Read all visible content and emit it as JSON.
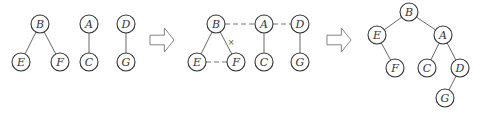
{
  "diagram": {
    "type": "tree-transformation",
    "node_radius": 9,
    "colors": {
      "node_stroke": "#333333",
      "edge": "#666666",
      "arrow_stroke": "#777777",
      "background": "#ffffff"
    },
    "panels": [
      {
        "id": "forest",
        "nodes": [
          {
            "id": "B",
            "label": "B",
            "x": 40,
            "y": 24
          },
          {
            "id": "E",
            "label": "E",
            "x": 21,
            "y": 62
          },
          {
            "id": "F",
            "label": "F",
            "x": 60,
            "y": 62
          },
          {
            "id": "A",
            "label": "A",
            "x": 89,
            "y": 24
          },
          {
            "id": "C",
            "label": "C",
            "x": 89,
            "y": 62
          },
          {
            "id": "D",
            "label": "D",
            "x": 126,
            "y": 24
          },
          {
            "id": "G",
            "label": "G",
            "x": 126,
            "y": 62
          }
        ],
        "edges": [
          {
            "from": "B",
            "to": "E",
            "style": "solid"
          },
          {
            "from": "B",
            "to": "F",
            "style": "solid"
          },
          {
            "from": "A",
            "to": "C",
            "style": "solid"
          },
          {
            "from": "D",
            "to": "G",
            "style": "solid"
          }
        ]
      },
      {
        "id": "intermediate",
        "nodes": [
          {
            "id": "B",
            "label": "B",
            "x": 216,
            "y": 24
          },
          {
            "id": "E",
            "label": "E",
            "x": 197,
            "y": 62
          },
          {
            "id": "F",
            "label": "F",
            "x": 236,
            "y": 62
          },
          {
            "id": "A",
            "label": "A",
            "x": 264,
            "y": 24
          },
          {
            "id": "C",
            "label": "C",
            "x": 264,
            "y": 62
          },
          {
            "id": "D",
            "label": "D",
            "x": 300,
            "y": 24
          },
          {
            "id": "G",
            "label": "G",
            "x": 300,
            "y": 62
          }
        ],
        "edges": [
          {
            "from": "B",
            "to": "E",
            "style": "solid"
          },
          {
            "from": "B",
            "to": "F",
            "style": "solid"
          },
          {
            "from": "A",
            "to": "C",
            "style": "solid"
          },
          {
            "from": "D",
            "to": "G",
            "style": "solid"
          },
          {
            "from": "B",
            "to": "A",
            "style": "dashed"
          },
          {
            "from": "A",
            "to": "D",
            "style": "dashed"
          },
          {
            "from": "E",
            "to": "F",
            "style": "dashed"
          }
        ],
        "marks": [
          {
            "label": "×",
            "x": 231,
            "y": 42,
            "meaning": "remove edge B-F"
          }
        ]
      },
      {
        "id": "binary-tree",
        "nodes": [
          {
            "id": "B",
            "label": "B",
            "x": 409,
            "y": 12
          },
          {
            "id": "E",
            "label": "E",
            "x": 377,
            "y": 35
          },
          {
            "id": "A",
            "label": "A",
            "x": 443,
            "y": 35
          },
          {
            "id": "F",
            "label": "F",
            "x": 395,
            "y": 68
          },
          {
            "id": "C",
            "label": "C",
            "x": 427,
            "y": 68
          },
          {
            "id": "D",
            "label": "D",
            "x": 460,
            "y": 68
          },
          {
            "id": "G",
            "label": "G",
            "x": 445,
            "y": 98
          }
        ],
        "edges": [
          {
            "from": "B",
            "to": "E",
            "style": "solid"
          },
          {
            "from": "B",
            "to": "A",
            "style": "solid"
          },
          {
            "from": "E",
            "to": "F",
            "style": "solid"
          },
          {
            "from": "A",
            "to": "C",
            "style": "solid"
          },
          {
            "from": "A",
            "to": "D",
            "style": "solid"
          },
          {
            "from": "D",
            "to": "G",
            "style": "solid"
          }
        ]
      }
    ],
    "arrows": [
      {
        "id": "arrow-1",
        "x": 150,
        "y": 28,
        "w": 24,
        "h": 24
      },
      {
        "id": "arrow-2",
        "x": 327,
        "y": 28,
        "w": 24,
        "h": 24
      }
    ]
  }
}
